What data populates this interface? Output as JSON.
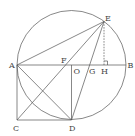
{
  "diagram": {
    "type": "geometry",
    "circle": {
      "center": "O",
      "cx": 71.5,
      "cy": 65,
      "r": 54.5
    },
    "points": {
      "A": {
        "label": "A",
        "x": 17,
        "y": 65
      },
      "B": {
        "label": "B",
        "x": 126,
        "y": 65
      },
      "O": {
        "label": "O",
        "x": 71.5,
        "y": 65
      },
      "E": {
        "label": "E",
        "x": 104,
        "y": 21.5
      },
      "F": {
        "label": "F",
        "x": 64,
        "y": 65
      },
      "G": {
        "label": "G",
        "x": 89,
        "y": 65
      },
      "H": {
        "label": "H",
        "x": 104,
        "y": 65
      },
      "C": {
        "label": "C",
        "x": 17,
        "y": 120
      },
      "D": {
        "label": "D",
        "x": 71.5,
        "y": 120
      }
    },
    "segments": [
      [
        "A",
        "B"
      ],
      [
        "A",
        "E"
      ],
      [
        "A",
        "C"
      ],
      [
        "C",
        "D"
      ],
      [
        "O",
        "D"
      ],
      [
        "A",
        "D"
      ],
      [
        "C",
        "E"
      ],
      [
        "D",
        "E"
      ]
    ],
    "dashed_segments": [
      [
        "E",
        "H"
      ]
    ],
    "right_angle_marks": [
      {
        "at": "H"
      }
    ]
  }
}
